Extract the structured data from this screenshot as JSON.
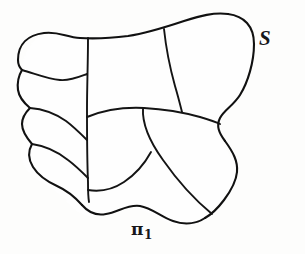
{
  "figure": {
    "type": "line-diagram",
    "background_color": "#fdfdfc",
    "stroke_color": "#111111",
    "labels": {
      "surface": "S",
      "partition_symbol": "π",
      "partition_subscript": "1"
    }
  }
}
